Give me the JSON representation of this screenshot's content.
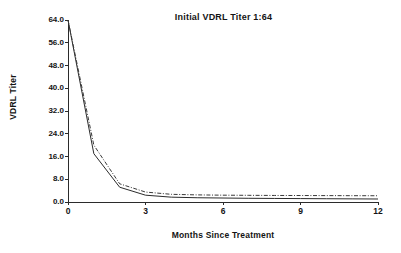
{
  "chart_data": {
    "type": "line",
    "title": "Initial VDRL Titer 1:64",
    "xlabel": "Months Since Treatment",
    "ylabel": "VDRL Titer",
    "xlim": [
      0,
      12
    ],
    "ylim": [
      0,
      64
    ],
    "grid": false,
    "legend": "none",
    "xticks": [
      "0",
      "3",
      "6",
      "9",
      "12"
    ],
    "xtick_values": [
      0,
      3,
      6,
      9,
      12
    ],
    "yticks": [
      "0.0",
      "8.0",
      "16.0",
      "24.0",
      "32.0",
      "40.0",
      "48.0",
      "56.0",
      "64.0"
    ],
    "ytick_values": [
      0,
      8,
      16,
      24,
      32,
      40,
      48,
      56,
      64
    ],
    "x": [
      0,
      1,
      2,
      3,
      4,
      5,
      6,
      7,
      8,
      9,
      10,
      11,
      12
    ],
    "series": [
      {
        "name": "solid-curve",
        "style": "solid",
        "color": "#2b2b2b",
        "values": [
          64,
          17.0,
          5.2,
          2.4,
          1.7,
          1.5,
          1.4,
          1.3,
          1.25,
          1.2,
          1.15,
          1.1,
          1.05
        ]
      },
      {
        "name": "dash-dot-curve",
        "style": "dash-dot",
        "color": "#3a3a3a",
        "values": [
          64,
          20.0,
          6.4,
          3.5,
          2.7,
          2.5,
          2.4,
          2.35,
          2.3,
          2.28,
          2.25,
          2.22,
          2.2
        ]
      }
    ]
  }
}
